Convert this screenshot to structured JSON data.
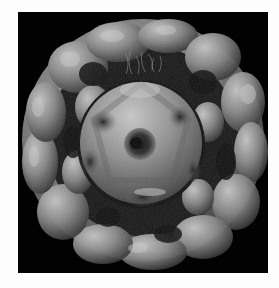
{
  "image": {
    "subject": "3D rendered virus capsid structure",
    "description": "Grayscale surface rendering of a spherical particle with a lumpy outer shell and a smooth inner sphere showing a pentagonal pore, on a black background",
    "colors": {
      "page_background": "#fdfdfd",
      "frame_background": "#020202",
      "shell_light": "#b8b8b8",
      "shell_mid": "#7a7a7a",
      "shell_dark": "#2a2a2a",
      "core_light": "#c4c4c4",
      "core_mid": "#8a8a8a"
    }
  }
}
